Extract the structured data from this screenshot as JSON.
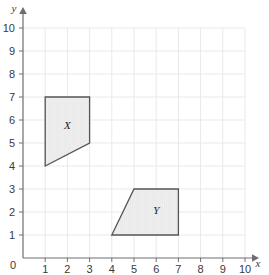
{
  "chart_data": {
    "type": "scatter",
    "title": "",
    "xlabel": "x",
    "ylabel": "y",
    "xlim": [
      0,
      10
    ],
    "ylim": [
      0,
      10
    ],
    "grid": true,
    "legend": "none",
    "x_ticks": [
      "0",
      "1",
      "2",
      "3",
      "4",
      "5",
      "6",
      "7",
      "8",
      "9",
      "10"
    ],
    "y_ticks": [
      "0",
      "1",
      "2",
      "3",
      "4",
      "5",
      "6",
      "7",
      "8",
      "9",
      "10"
    ],
    "origin_label": "0",
    "shapes": [
      {
        "name": "X",
        "label": "X",
        "type": "quadrilateral",
        "vertices": [
          [
            1,
            7
          ],
          [
            3,
            7
          ],
          [
            3,
            5
          ],
          [
            1,
            4
          ]
        ],
        "label_position": [
          2,
          5.8
        ],
        "fill": "#eeeeee",
        "stroke": "#555555"
      },
      {
        "name": "Y",
        "label": "Y",
        "type": "trapezoid",
        "vertices": [
          [
            4,
            1
          ],
          [
            5,
            3
          ],
          [
            7,
            3
          ],
          [
            7,
            1
          ]
        ],
        "label_position": [
          6,
          2.1
        ],
        "fill": "#eeeeee",
        "stroke": "#555555"
      }
    ]
  },
  "colors": {
    "background": "#ffffff",
    "grid_line": "#e9e9e9",
    "axis_line": "#6e6e6e",
    "tick_text": "#3a3a3a",
    "shape_fill": "#eeeeee",
    "shape_stroke": "#555555"
  },
  "axes": {
    "x_axis_label": "x",
    "y_axis_label": "y"
  }
}
